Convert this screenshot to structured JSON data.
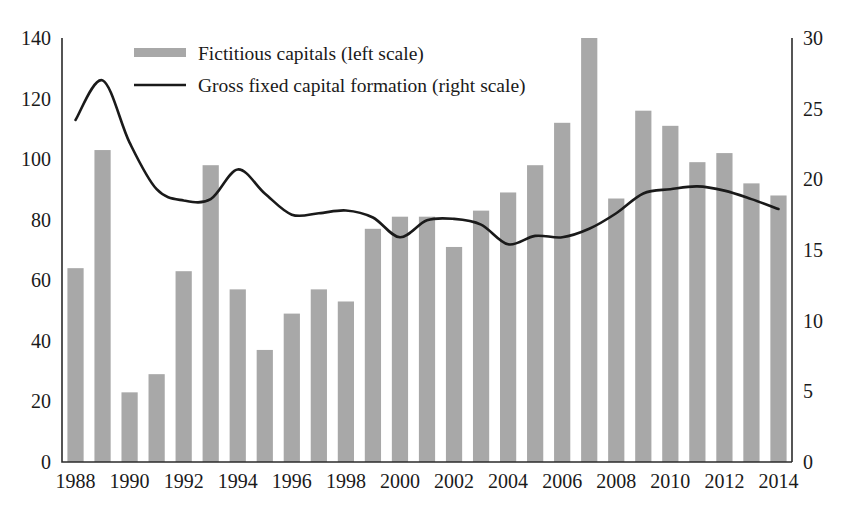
{
  "chart_data": {
    "type": "bar",
    "title": "",
    "subtitle": "",
    "xlabel": "",
    "ylabel": "",
    "grid": false,
    "legend_position": "top-left",
    "x": [
      1988,
      1989,
      1990,
      1991,
      1992,
      1993,
      1994,
      1995,
      1996,
      1997,
      1998,
      1999,
      2000,
      2001,
      2002,
      2003,
      2004,
      2005,
      2006,
      2007,
      2008,
      2009,
      2010,
      2011,
      2012,
      2013,
      2014
    ],
    "categories": [
      "1988",
      "1989",
      "1990",
      "1991",
      "1992",
      "1993",
      "1994",
      "1995",
      "1996",
      "1997",
      "1998",
      "1999",
      "2000",
      "2001",
      "2002",
      "2003",
      "2004",
      "2005",
      "2006",
      "2007",
      "2008",
      "2009",
      "2010",
      "2011",
      "2012",
      "2013",
      "2014"
    ],
    "x_tick_labels": [
      "1988",
      "1990",
      "1992",
      "1994",
      "1996",
      "1998",
      "2000",
      "2002",
      "2004",
      "2006",
      "2008",
      "2010",
      "2012",
      "2014"
    ],
    "x_tick_values": [
      1988,
      1990,
      1992,
      1994,
      1996,
      1998,
      2000,
      2002,
      2004,
      2006,
      2008,
      2010,
      2012,
      2014
    ],
    "left_axis": {
      "label": "",
      "ylim": [
        0,
        140
      ],
      "ticks": [
        0,
        20,
        40,
        60,
        80,
        100,
        120,
        140
      ],
      "tick_labels": [
        "0",
        "20",
        "40",
        "60",
        "80",
        "100",
        "120",
        "140"
      ]
    },
    "right_axis": {
      "label": "",
      "ylim": [
        0,
        30
      ],
      "ticks": [
        0,
        5,
        10,
        15,
        20,
        25,
        30
      ],
      "tick_labels": [
        "0",
        "5",
        "10",
        "15",
        "20",
        "25",
        "30"
      ]
    },
    "series": [
      {
        "name": "Fictitious capitals (left scale)",
        "type": "bar",
        "axis": "left",
        "color": "#a8a8a8",
        "values": [
          64,
          103,
          23,
          29,
          63,
          98,
          57,
          37,
          49,
          57,
          53,
          77,
          81,
          81,
          71,
          83,
          89,
          98,
          112,
          140,
          87,
          116,
          111,
          99,
          102,
          92,
          88
        ]
      },
      {
        "name": "Gross fixed capital formation (right scale)",
        "type": "line",
        "axis": "right",
        "color": "#1a1a1a",
        "values": [
          24.2,
          27.0,
          22.6,
          19.3,
          18.5,
          18.6,
          20.7,
          19.0,
          17.5,
          17.6,
          17.8,
          17.3,
          15.9,
          17.1,
          17.2,
          16.8,
          15.4,
          16.0,
          15.9,
          16.5,
          17.6,
          19.0,
          19.3,
          19.5,
          19.2,
          18.6,
          17.9
        ]
      }
    ],
    "legend": [
      {
        "label": "Fictitious capitals (left scale)",
        "marker": "swatch",
        "color": "#a8a8a8"
      },
      {
        "label": "Gross fixed capital formation (right scale)",
        "marker": "line",
        "color": "#1a1a1a"
      }
    ]
  }
}
